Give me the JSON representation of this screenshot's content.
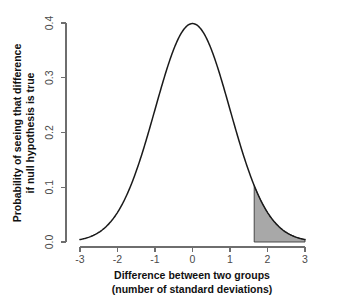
{
  "chart_data": {
    "type": "line",
    "title": "",
    "subtitle": "",
    "xlabel_line1": "Difference between two groups",
    "xlabel_line2": "(number of standard deviations)",
    "ylabel_line1": "Probability of seeing that difference",
    "ylabel_line2": "if null hypothesis is true",
    "xlim": [
      -3,
      3
    ],
    "ylim": [
      0.0,
      0.4
    ],
    "xticks": [
      -3,
      -2,
      -1,
      0,
      1,
      2,
      3
    ],
    "xtick_labels": [
      "-3",
      "-2",
      "-1",
      "0",
      "1",
      "2",
      "3"
    ],
    "yticks": [
      0.0,
      0.1,
      0.2,
      0.3,
      0.4
    ],
    "ytick_labels": [
      "0.0",
      "0.1",
      "0.2",
      "0.3",
      "0.4"
    ],
    "grid": false,
    "legend": "none",
    "series": [
      {
        "name": "Standard normal density",
        "distribution": "normal",
        "mean": 0,
        "sd": 1,
        "peak_value": 0.3989,
        "x": [
          -3.0,
          -2.8,
          -2.6,
          -2.4,
          -2.2,
          -2.0,
          -1.8,
          -1.6,
          -1.4,
          -1.2,
          -1.0,
          -0.8,
          -0.6,
          -0.4,
          -0.2,
          0.0,
          0.2,
          0.4,
          0.6,
          0.8,
          1.0,
          1.2,
          1.4,
          1.6,
          1.8,
          2.0,
          2.2,
          2.4,
          2.6,
          2.8,
          3.0
        ],
        "values": [
          0.0044,
          0.0079,
          0.0136,
          0.0224,
          0.0355,
          0.054,
          0.079,
          0.1109,
          0.1497,
          0.1942,
          0.242,
          0.2897,
          0.3332,
          0.3683,
          0.391,
          0.3989,
          0.391,
          0.3683,
          0.3332,
          0.2897,
          0.242,
          0.1942,
          0.1497,
          0.1109,
          0.079,
          0.054,
          0.0355,
          0.0224,
          0.0136,
          0.0079,
          0.0044
        ]
      }
    ],
    "shaded_region": {
      "name": "rejection-region-right-tail",
      "x_start": 1.645,
      "x_end": 3.0,
      "fill_color": "#a8a8a8",
      "edge_color": "#3a3a3a",
      "area": 0.05
    },
    "colors": {
      "curve": "#1a1a1a",
      "axis": "#6e6e6e",
      "tick_label": "#4a4a4a",
      "axis_title": "#111111",
      "shade_fill": "#a8a8a8",
      "background": "#ffffff"
    }
  }
}
